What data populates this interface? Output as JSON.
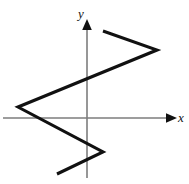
{
  "figure": {
    "width": 189,
    "height": 184,
    "background": "#ffffff"
  },
  "axes": {
    "x_label": "x",
    "y_label": "y",
    "origin": {
      "x": 87,
      "y": 118
    },
    "color": "#7d7d7d",
    "arrow_color": "#111111",
    "x_axis": {
      "x1": 3,
      "y1": 118,
      "x2": 170,
      "y2": 118,
      "arrow_tip_x": 177,
      "arrow": "right"
    },
    "y_axis": {
      "x1": 87,
      "y1": 178,
      "x2": 87,
      "y2": 26,
      "arrow_tip_y": 19,
      "arrow": "up"
    }
  },
  "chart_data": {
    "type": "line",
    "title": "",
    "xlabel": "x",
    "ylabel": "y",
    "grid": false,
    "legend": null,
    "axis_arrows": true,
    "stroke_color": "#111111",
    "stroke_width": 3.1,
    "series": [
      {
        "name": "zigzag-relation",
        "points_px": [
          {
            "x": 103,
            "y": 31
          },
          {
            "x": 157,
            "y": 50
          },
          {
            "x": 18,
            "y": 107
          },
          {
            "x": 103,
            "y": 152
          },
          {
            "x": 57,
            "y": 174
          }
        ]
      }
    ]
  }
}
